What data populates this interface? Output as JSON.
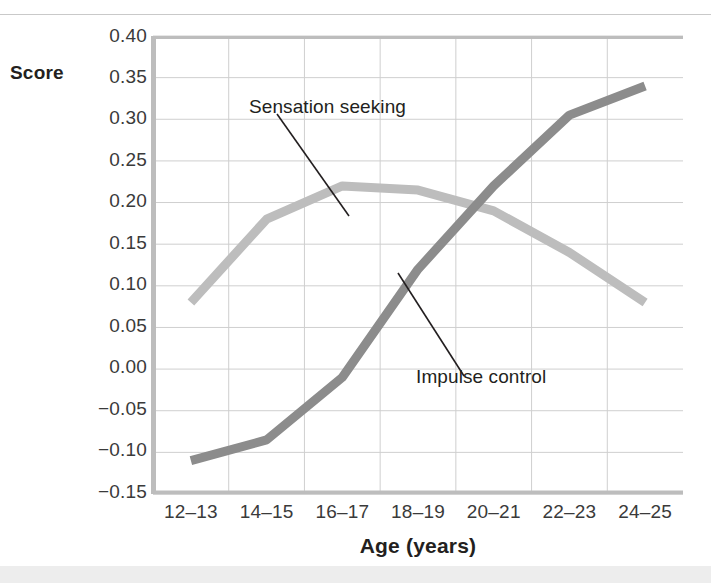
{
  "chart_data": {
    "type": "line",
    "title": "",
    "xlabel": "Age (years)",
    "ylabel": "Score",
    "categories": [
      "12–13",
      "14–15",
      "16–17",
      "18–19",
      "20–21",
      "22–23",
      "24–25"
    ],
    "ylim": [
      -0.15,
      0.4
    ],
    "yticks": [
      "0.40",
      "0.35",
      "0.30",
      "0.25",
      "0.20",
      "0.15",
      "0.10",
      "0.05",
      "0.00",
      "−0.05",
      "−0.10",
      "−0.15"
    ],
    "ytick_values": [
      0.4,
      0.35,
      0.3,
      0.25,
      0.2,
      0.15,
      0.1,
      0.05,
      0.0,
      -0.05,
      -0.1,
      -0.15
    ],
    "grid": true,
    "legend": "none (direct labels with leader lines)",
    "series": [
      {
        "name": "Sensation seeking",
        "color": "#bdbdbd",
        "values": [
          0.08,
          0.18,
          0.22,
          0.215,
          0.19,
          0.14,
          0.08
        ]
      },
      {
        "name": "Impulse control",
        "color": "#8c8c8c",
        "values": [
          -0.11,
          -0.085,
          -0.01,
          0.12,
          0.22,
          0.305,
          0.34
        ]
      }
    ],
    "annotations": [
      {
        "text": "Sensation seeking",
        "series": "Sensation seeking"
      },
      {
        "text": "Impulse control",
        "series": "Impulse control"
      }
    ]
  },
  "axis": {
    "score_label": "Score",
    "x_title": "Age (years)"
  },
  "colors": {
    "sensation_seeking": "#bdbdbd",
    "impulse_control": "#8c8c8c",
    "grid": "#cfcfcf",
    "axis_spine": "#c0c0c0",
    "text": "#231f20"
  }
}
